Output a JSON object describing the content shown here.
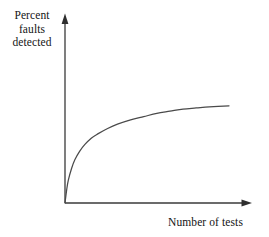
{
  "figure": {
    "background_color": "#ffffff",
    "line_color": "#3a3a3a",
    "text_color": "#141414"
  },
  "y_axis": {
    "label_lines": [
      "Percent",
      "faults",
      "detected"
    ],
    "label_full": "Percent faults detected",
    "arrow": "up-arrow"
  },
  "x_axis": {
    "label": "Number of tests",
    "arrow": "right-arrow"
  },
  "chart_data": {
    "type": "line",
    "title": "",
    "subtitle": "",
    "xlabel": "Number of tests",
    "ylabel": "Percent faults detected",
    "xlim": [
      0,
      100
    ],
    "ylim": [
      0,
      100
    ],
    "grid": false,
    "legend": false,
    "legend_position": "none",
    "axis_style": "arrow-headed, no tick marks, no tick labels",
    "annotations": [],
    "series": [
      {
        "name": "Fault detection curve",
        "description": "Concave saturating (logarithmic) curve rising steeply from the origin then flattening toward an asymptote",
        "x": [
          0,
          1,
          2,
          4,
          6,
          9,
          12,
          16,
          20,
          26,
          32,
          40,
          48,
          56,
          64,
          72,
          80,
          88,
          100
        ],
        "y": [
          0,
          12,
          21,
          32,
          40,
          48,
          54,
          60,
          64,
          69,
          73,
          77,
          80,
          83,
          85,
          87,
          88,
          89,
          90
        ]
      }
    ]
  }
}
